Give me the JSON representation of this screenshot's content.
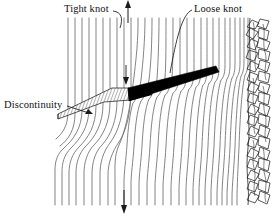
{
  "figure": {
    "type": "technical-line-diagram",
    "width": 275,
    "height": 216,
    "background": "#ffffff",
    "ink_color": "#1a1a1a",
    "grain_color": "#6b6b6b",
    "knot_fill": "#000000",
    "hatch_color": "#555555"
  },
  "labels": {
    "tight_knot": "Tight knot",
    "loose_knot": "Loose knot",
    "discontinuity": "Discontinuity"
  },
  "annotations": [
    {
      "name": "tight-knot-label",
      "text": "Tight knot",
      "text_x": 64,
      "text_y": 3,
      "leader": "M114,12 C122,13 122,19 120,27",
      "target": [
        120,
        27
      ]
    },
    {
      "name": "loose-knot-label",
      "text": "Loose knot",
      "text_x": 194,
      "text_y": 3,
      "leader": "M192,11 C183,14 176,40 170,72",
      "target": [
        170,
        72
      ]
    },
    {
      "name": "discontinuity-label",
      "text": "Discontinuity",
      "text_x": 4,
      "text_y": 99,
      "leader": "M67,106 L90,113",
      "target": [
        92,
        113
      ]
    }
  ],
  "arrows": {
    "top_axis_arrow": {
      "name": "grain-direction-arrow-up",
      "x": 128,
      "y_from": 22,
      "y_to": 2,
      "direction": "up"
    },
    "bottom_axis_arrow": {
      "name": "grain-direction-arrow-down",
      "x": 124,
      "y_from": 190,
      "y_to": 212,
      "direction": "down"
    },
    "knot_tip_arrow": {
      "name": "knot-tip-arrow-down",
      "x": 126,
      "y_from": 66,
      "y_to": 84,
      "direction": "down"
    }
  },
  "features": {
    "tight_knot": {
      "name": "tight-knot-wedge",
      "style": "hatched",
      "polygon": "58,119 104,102 130,100 129,88 112,88 58,114"
    },
    "loose_knot": {
      "name": "loose-knot-wedge",
      "style": "solid-black",
      "polygon": "129,101 219,72 216,67 128,88"
    },
    "bark": {
      "name": "bark-texture-strip",
      "x_from": 244,
      "x_to": 272,
      "y_from": 18,
      "y_to": 205,
      "style": "irregular-scribble"
    },
    "grain": {
      "name": "wood-grain-lines",
      "count": 30,
      "x_from": 68,
      "x_to": 248,
      "y_from": 18,
      "y_to": 205,
      "description": "Near-vertical wood grain fibers deflected around the knots"
    }
  }
}
